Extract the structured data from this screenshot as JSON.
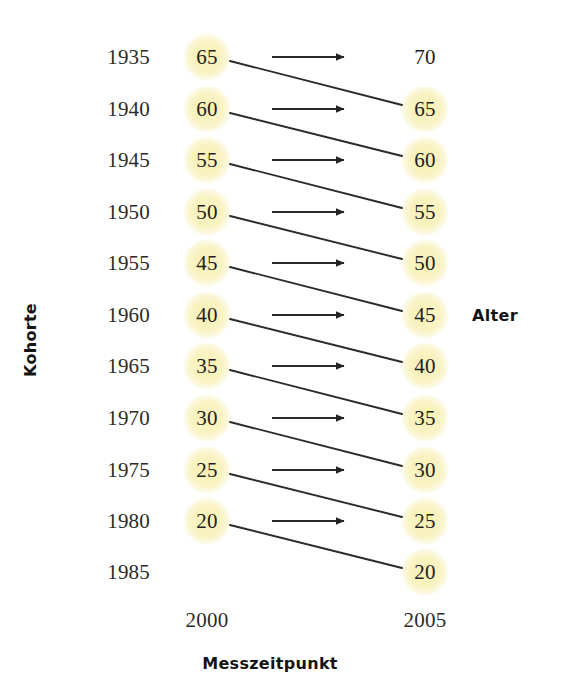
{
  "figure": {
    "kind": "cohort-sequential-design-diagram",
    "axis_titles": {
      "y_left": "Kohorte",
      "y_right": "Alter",
      "x_bottom": "Messzeitpunkt"
    },
    "colors": {
      "node_fill": "#f8f2bd",
      "node_fill_soft": "#fbf7d8",
      "line": "#2a2a2a",
      "text": "#1f1f1f",
      "background": "#ffffff"
    },
    "time_points": [
      {
        "label": "2000",
        "x": 207
      },
      {
        "label": "2005",
        "x": 425
      }
    ],
    "cohorts": [
      {
        "label": "1935",
        "y": 57,
        "age_2000": "65",
        "age_2005": "70",
        "circle_2000": true,
        "circle_2005": false,
        "arrow": true
      },
      {
        "label": "1940",
        "y": 109,
        "age_2000": "60",
        "age_2005": "65",
        "circle_2000": true,
        "circle_2005": true,
        "arrow": true
      },
      {
        "label": "1945",
        "y": 160,
        "age_2000": "55",
        "age_2005": "60",
        "circle_2000": true,
        "circle_2005": true,
        "arrow": true
      },
      {
        "label": "1950",
        "y": 212,
        "age_2000": "50",
        "age_2005": "55",
        "circle_2000": true,
        "circle_2005": true,
        "arrow": true
      },
      {
        "label": "1955",
        "y": 263,
        "age_2000": "45",
        "age_2005": "50",
        "circle_2000": true,
        "circle_2005": true,
        "arrow": true
      },
      {
        "label": "1960",
        "y": 315,
        "age_2000": "40",
        "age_2005": "45",
        "circle_2000": true,
        "circle_2005": true,
        "arrow": true
      },
      {
        "label": "1965",
        "y": 366,
        "age_2000": "35",
        "age_2005": "40",
        "circle_2000": true,
        "circle_2005": true,
        "arrow": true
      },
      {
        "label": "1970",
        "y": 418,
        "age_2000": "30",
        "age_2005": "35",
        "circle_2000": true,
        "circle_2005": true,
        "arrow": true
      },
      {
        "label": "1975",
        "y": 470,
        "age_2000": "25",
        "age_2005": "30",
        "circle_2000": true,
        "circle_2005": true,
        "arrow": true
      },
      {
        "label": "1980",
        "y": 521,
        "age_2000": "20",
        "age_2005": "25",
        "circle_2000": true,
        "circle_2005": true,
        "arrow": true
      },
      {
        "label": "1985",
        "y": 572,
        "age_2000": "",
        "age_2005": "20",
        "circle_2000": false,
        "circle_2005": true,
        "arrow": false
      }
    ],
    "cohort_label_x": 150,
    "time_label_y": 620,
    "node_radius": 25,
    "arrow": {
      "x_start": 272,
      "x_end": 351
    },
    "diagonals": [
      {
        "from_cohort": "1935",
        "to_cohort": "1940"
      },
      {
        "from_cohort": "1940",
        "to_cohort": "1945"
      },
      {
        "from_cohort": "1945",
        "to_cohort": "1950"
      },
      {
        "from_cohort": "1950",
        "to_cohort": "1955"
      },
      {
        "from_cohort": "1955",
        "to_cohort": "1960"
      },
      {
        "from_cohort": "1960",
        "to_cohort": "1965"
      },
      {
        "from_cohort": "1965",
        "to_cohort": "1970"
      },
      {
        "from_cohort": "1970",
        "to_cohort": "1975"
      },
      {
        "from_cohort": "1975",
        "to_cohort": "1980"
      },
      {
        "from_cohort": "1980",
        "to_cohort": "1985"
      }
    ]
  }
}
